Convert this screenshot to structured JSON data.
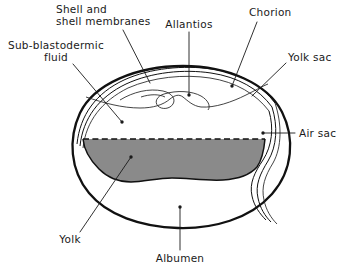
{
  "figure": {
    "kind": "anatomical-line-diagram",
    "background_color": "#ffffff",
    "ink_color": "#111111",
    "yolk_fill_color": "#8a8a8a"
  },
  "labels": {
    "shell_and_membranes": {
      "line1": "Shell and",
      "line2": "shell membranes"
    },
    "allantois": "Allantios",
    "chorion": "Chorion",
    "yolk_sac": "Yolk sac",
    "sub_blastodermic_fluid": {
      "line1": "Sub-blastodermic",
      "line2": "fluid"
    },
    "air_sac": "Air sac",
    "yolk": "Yolk",
    "albumen": "Albumen"
  },
  "parts": [
    "Shell and shell membranes",
    "Allantios",
    "Chorion",
    "Yolk sac",
    "Sub-blastodermic fluid",
    "Air sac",
    "Yolk",
    "Albumen"
  ]
}
